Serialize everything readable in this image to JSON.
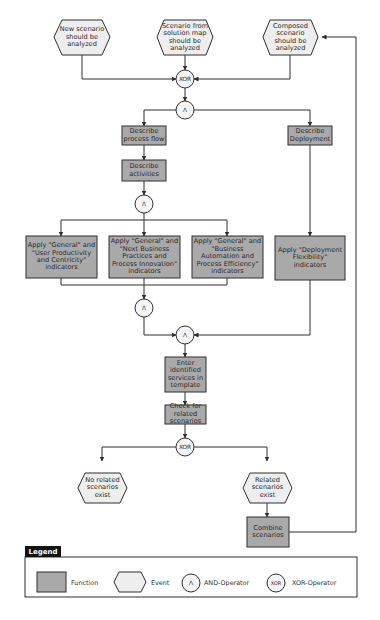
{
  "colors": {
    "function_fill": "#a9a9a9",
    "event_fill": "#eeeeee",
    "operator_fill": "#f5f5f5",
    "stroke": "#2f2f2f",
    "legend_tab": "#111111"
  },
  "events": {
    "new_scenario": "New scenario\nshould be\nanalyzed",
    "solution_map": "Scenario from\nsolution map\nshould be\nanalyzed",
    "composed": "Composed\nscenario\nshould be\nanalyzed",
    "no_related": "No related\nscenarios\nexist",
    "related": "Related\nscenarios\nexist"
  },
  "functions": {
    "describe_process_flow": "Describe\nprocess flow",
    "describe_deployment": "Describe\nDeployment",
    "describe_activities": "Describe\nactivities",
    "apply_user_productivity": "Apply \"General\" and\n\"User Productivity\nand Centricity\"\nindicators",
    "apply_next_business": "Apply \"General\" and\n\"Next Business\nPractices and\nProcess Innovation\"\nindicators",
    "apply_business_automation": "Apply \"General\" and\n\"Business\nAutomation and\nProcess Efficiency\"\nindicators",
    "apply_deployment_flexibility": "Apply \"Deployment\nFlexibility\"\nindicators",
    "enter_services": "Enter\nidentified\nservices in\ntemplate",
    "check_related": "Check for\nrelated\nscenarios",
    "combine_scenarios": "Combine\nscenarios"
  },
  "operators": {
    "xor_top": "XOR",
    "and_split_top": "Λ",
    "and_split_activities": "Λ",
    "and_join_apply": "Λ",
    "and_join_final": "Λ",
    "xor_bottom": "XOR"
  },
  "legend": {
    "title": "Legend",
    "function_label": "Function",
    "event_label": "Event",
    "and_symbol": "Λ",
    "and_label": "AND-Operator",
    "xor_symbol": "XOR",
    "xor_label": "XOR-Operator"
  }
}
